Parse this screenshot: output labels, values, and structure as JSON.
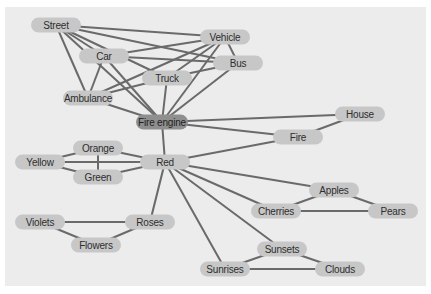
{
  "diagram": {
    "type": "association-network",
    "colors": {
      "background": "#ececec",
      "node_fill": "#c7c7c7",
      "hub_fill": "#8f8f8f",
      "edge": "#6a6a6a",
      "text": "#2e2e2e"
    },
    "nodes": [
      {
        "id": "street",
        "label": "Street",
        "x": 56,
        "y": 25,
        "w": 50
      },
      {
        "id": "vehicle",
        "label": "Vehicle",
        "x": 225,
        "y": 37,
        "w": 50
      },
      {
        "id": "car",
        "label": "Car",
        "x": 104,
        "y": 56,
        "w": 50
      },
      {
        "id": "bus",
        "label": "Bus",
        "x": 238,
        "y": 63,
        "w": 50
      },
      {
        "id": "truck",
        "label": "Truck",
        "x": 167,
        "y": 78,
        "w": 50
      },
      {
        "id": "ambulance",
        "label": "Ambulance",
        "x": 88,
        "y": 98,
        "w": 50
      },
      {
        "id": "fire_engine",
        "label": "Fire engine",
        "x": 162,
        "y": 122,
        "w": 52,
        "hub": true
      },
      {
        "id": "house",
        "label": "House",
        "x": 360,
        "y": 114,
        "w": 50
      },
      {
        "id": "fire",
        "label": "Fire",
        "x": 298,
        "y": 137,
        "w": 50
      },
      {
        "id": "orange",
        "label": "Orange",
        "x": 98,
        "y": 148,
        "w": 50
      },
      {
        "id": "yellow",
        "label": "Yellow",
        "x": 40,
        "y": 162,
        "w": 50
      },
      {
        "id": "red",
        "label": "Red",
        "x": 165,
        "y": 162,
        "w": 50
      },
      {
        "id": "green",
        "label": "Green",
        "x": 98,
        "y": 177,
        "w": 50
      },
      {
        "id": "apples",
        "label": "Apples",
        "x": 334,
        "y": 190,
        "w": 50
      },
      {
        "id": "cherries",
        "label": "Cherries",
        "x": 276,
        "y": 211,
        "w": 50
      },
      {
        "id": "pears",
        "label": "Pears",
        "x": 393,
        "y": 211,
        "w": 50
      },
      {
        "id": "violets",
        "label": "Violets",
        "x": 40,
        "y": 222,
        "w": 50
      },
      {
        "id": "roses",
        "label": "Roses",
        "x": 150,
        "y": 222,
        "w": 50
      },
      {
        "id": "flowers",
        "label": "Flowers",
        "x": 96,
        "y": 245,
        "w": 50
      },
      {
        "id": "sunsets",
        "label": "Sunsets",
        "x": 282,
        "y": 249,
        "w": 50
      },
      {
        "id": "sunrises",
        "label": "Sunrises",
        "x": 225,
        "y": 269,
        "w": 50
      },
      {
        "id": "clouds",
        "label": "Clouds",
        "x": 340,
        "y": 269,
        "w": 50
      }
    ],
    "edges": [
      [
        "street",
        "vehicle"
      ],
      [
        "street",
        "bus"
      ],
      [
        "street",
        "car"
      ],
      [
        "street",
        "truck"
      ],
      [
        "street",
        "ambulance"
      ],
      [
        "street",
        "fire_engine"
      ],
      [
        "car",
        "vehicle"
      ],
      [
        "car",
        "bus"
      ],
      [
        "car",
        "ambulance"
      ],
      [
        "car",
        "fire_engine"
      ],
      [
        "vehicle",
        "bus"
      ],
      [
        "vehicle",
        "truck"
      ],
      [
        "vehicle",
        "ambulance"
      ],
      [
        "vehicle",
        "fire_engine"
      ],
      [
        "bus",
        "truck"
      ],
      [
        "bus",
        "fire_engine"
      ],
      [
        "truck",
        "ambulance"
      ],
      [
        "truck",
        "fire_engine"
      ],
      [
        "ambulance",
        "fire_engine"
      ],
      [
        "fire_engine",
        "house"
      ],
      [
        "fire_engine",
        "fire"
      ],
      [
        "fire_engine",
        "red"
      ],
      [
        "house",
        "fire"
      ],
      [
        "red",
        "fire"
      ],
      [
        "red",
        "apples"
      ],
      [
        "red",
        "cherries"
      ],
      [
        "red",
        "sunsets"
      ],
      [
        "red",
        "sunrises"
      ],
      [
        "red",
        "roses"
      ],
      [
        "red",
        "orange"
      ],
      [
        "red",
        "yellow"
      ],
      [
        "red",
        "green"
      ],
      [
        "yellow",
        "orange"
      ],
      [
        "yellow",
        "green"
      ],
      [
        "orange",
        "green"
      ],
      [
        "apples",
        "cherries"
      ],
      [
        "apples",
        "pears"
      ],
      [
        "cherries",
        "pears"
      ],
      [
        "violets",
        "roses"
      ],
      [
        "violets",
        "flowers"
      ],
      [
        "roses",
        "flowers"
      ],
      [
        "sunsets",
        "sunrises"
      ],
      [
        "sunsets",
        "clouds"
      ],
      [
        "sunrises",
        "clouds"
      ]
    ]
  }
}
